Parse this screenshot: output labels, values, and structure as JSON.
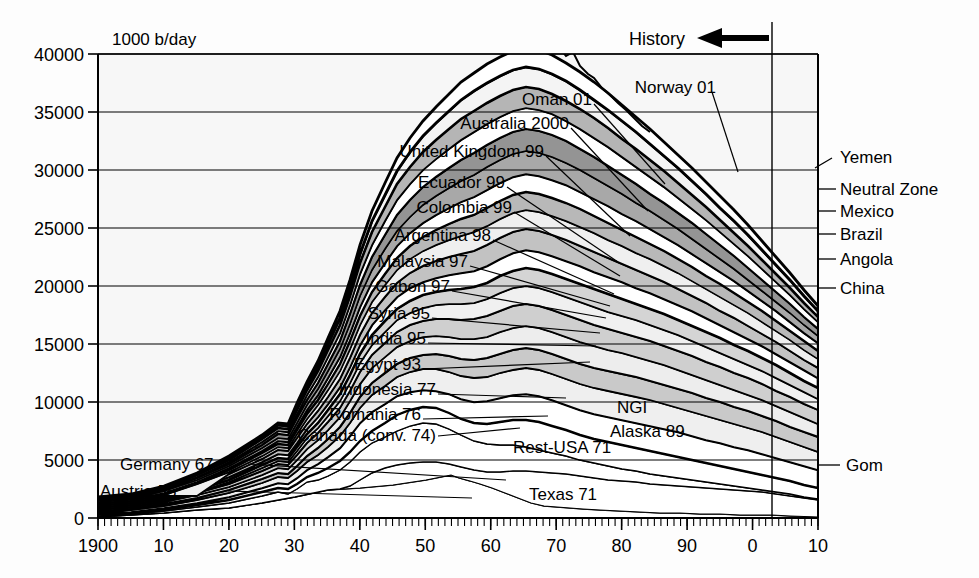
{
  "chart_data": {
    "type": "area",
    "title": "",
    "subtitle": "",
    "ylabel": "1000 b/day",
    "xlabel": "",
    "ylim": [
      0,
      40000
    ],
    "xlim": [
      1900,
      2010
    ],
    "ytick_values": [
      0,
      5000,
      10000,
      15000,
      20000,
      25000,
      30000,
      35000,
      40000
    ],
    "ytick_labels": [
      "0",
      "5000",
      "10000",
      "15000",
      "20000",
      "25000",
      "30000",
      "35000",
      "40000"
    ],
    "xtick_values": [
      1900,
      1910,
      1920,
      1930,
      1940,
      1950,
      1960,
      1970,
      1980,
      1990,
      2000,
      2010
    ],
    "xtick_labels": [
      "1900",
      "10",
      "20",
      "30",
      "40",
      "50",
      "60",
      "70",
      "80",
      "90",
      "0",
      "10"
    ],
    "minor_tick_step": 1,
    "grid": "horizontal",
    "legend": "none",
    "annotations": {
      "history_label": "History",
      "history_arrow": "left-arrow",
      "now_line_year": 2004
    },
    "stack_total": {
      "x": [
        1900,
        1905,
        1910,
        1915,
        1920,
        1925,
        1930,
        1935,
        1940,
        1945,
        1950,
        1955,
        1960,
        1965,
        1970,
        1973,
        1975,
        1979,
        1982,
        1985,
        1988,
        1990,
        1993,
        1996,
        1999,
        2001,
        2003,
        2004,
        2005,
        2006,
        2008,
        2010
      ],
      "y": [
        150,
        300,
        600,
        900,
        1900,
        2800,
        3800,
        4200,
        5600,
        6000,
        9500,
        13000,
        17500,
        24000,
        33500,
        37500,
        33000,
        38500,
        32000,
        33500,
        35500,
        36000,
        37500,
        39000,
        40500,
        40000,
        41500,
        42000,
        41500,
        40500,
        38000,
        35500
      ]
    },
    "series_left_labels": [
      {
        "label": "Oman 01",
        "peak_year": 2001
      },
      {
        "label": "Norway 01",
        "peak_year": 2001
      },
      {
        "label": "Australia 2000",
        "peak_year": 2000
      },
      {
        "label": "United Kingdom 99",
        "peak_year": 1999
      },
      {
        "label": "Ecuador 99",
        "peak_year": 1999
      },
      {
        "label": "Colombia 99",
        "peak_year": 1999
      },
      {
        "label": "Argentina 98",
        "peak_year": 1998
      },
      {
        "label": "Malaysia 97",
        "peak_year": 1997
      },
      {
        "label": "Gabon 97",
        "peak_year": 1997
      },
      {
        "label": "Syria 95",
        "peak_year": 1995
      },
      {
        "label": "India 95",
        "peak_year": 1995
      },
      {
        "label": "Egypt 93",
        "peak_year": 1993
      },
      {
        "label": "Indonesia 77",
        "peak_year": 1977
      },
      {
        "label": "Romania 76",
        "peak_year": 1976
      },
      {
        "label": "Canada (conv. 74)",
        "peak_year": 1974
      },
      {
        "label": "Germany 67",
        "peak_year": 1967
      },
      {
        "label": "Austria 55",
        "peak_year": 1955
      }
    ],
    "series_inner_labels": [
      {
        "label": "NGI"
      },
      {
        "label": "Alaska 89",
        "peak_year": 1989
      },
      {
        "label": "Rest-USA 71",
        "peak_year": 1971
      },
      {
        "label": "Texas 71",
        "peak_year": 1971
      }
    ],
    "series_right_labels": [
      {
        "label": "Yemen"
      },
      {
        "label": "Neutral Zone"
      },
      {
        "label": "Mexico"
      },
      {
        "label": "Brazil"
      },
      {
        "label": "Angola"
      },
      {
        "label": "China"
      },
      {
        "label": "Gom"
      }
    ]
  },
  "axis": {
    "unit_label": "1000 b/day",
    "y_labels": [
      "40000",
      "35000",
      "30000",
      "25000",
      "20000",
      "15000",
      "10000",
      "5000",
      "0"
    ],
    "x_labels": [
      "1900",
      "10",
      "20",
      "30",
      "40",
      "50",
      "60",
      "70",
      "80",
      "90",
      "0",
      "10"
    ]
  },
  "annotations": {
    "history": "History"
  },
  "labels_left": [
    "Oman 01",
    "Norway 01",
    "Australia 2000",
    "United Kingdom 99",
    "Ecuador 99",
    "Colombia 99",
    "Argentina 98",
    "Malaysia 97",
    "Gabon 97",
    "Syria 95",
    "India 95",
    "Egypt 93",
    "Indonesia 77",
    "Romania 76",
    "Canada (conv. 74)",
    "Germany 67",
    "Austria 55"
  ],
  "labels_inner": [
    "NGI",
    "Alaska 89",
    "Rest-USA 71",
    "Texas 71"
  ],
  "labels_right": [
    "Yemen",
    "Neutral Zone",
    "Mexico",
    "Brazil",
    "Angola",
    "China",
    "Gom"
  ],
  "colors": {
    "line": "#000000",
    "grid": "#000000",
    "fill_light": "#f2f2f2",
    "fill_mid": "#c4c4c4",
    "fill_dark": "#8e8e8e",
    "fill_darker": "#6e6e6e",
    "background": "#fdfdfd"
  }
}
